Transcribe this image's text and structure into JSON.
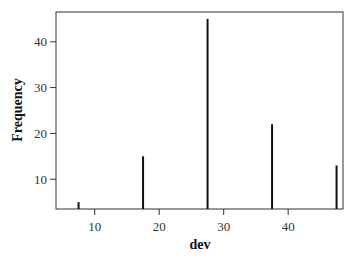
{
  "chart_data": {
    "type": "bar",
    "title": "",
    "xlabel": "dev",
    "ylabel": "Frequency",
    "x": [
      7.5,
      17.5,
      27.5,
      37.5,
      47.5
    ],
    "values": [
      5,
      15,
      45,
      22,
      13
    ],
    "xlim": [
      4,
      48.5
    ],
    "ylim": [
      3.5,
      46.5
    ],
    "xticks": [
      10,
      20,
      30,
      40
    ],
    "yticks": [
      10,
      20,
      30,
      40
    ],
    "grid": false,
    "legend": null,
    "bar_style": "spike",
    "colors": {
      "bar": "#111111",
      "axis": "#333333",
      "frame": "#333333"
    }
  }
}
